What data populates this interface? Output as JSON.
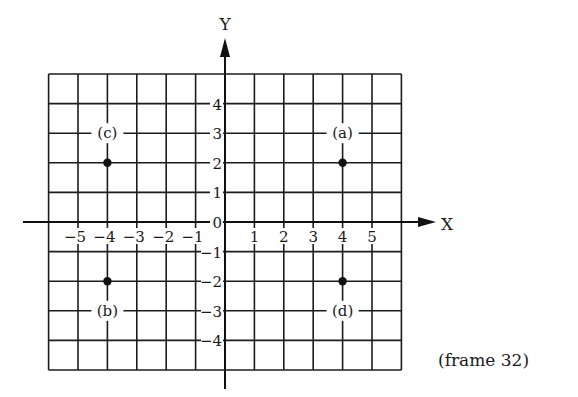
{
  "figure": {
    "caption": "(frame 32)",
    "x_axis_title": "X",
    "y_axis_title": "Y"
  },
  "chart_data": {
    "type": "scatter",
    "title": "",
    "xlabel": "X",
    "ylabel": "Y",
    "xlim": [
      -6,
      6
    ],
    "ylim": [
      -5,
      5
    ],
    "grid": true,
    "x_ticks": [
      -5,
      -4,
      -3,
      -2,
      -1,
      1,
      2,
      3,
      4,
      5
    ],
    "x_tick_labels": [
      "-5",
      "-4",
      "-3",
      "-2",
      "-1",
      "1",
      "2",
      "3",
      "4",
      "5"
    ],
    "y_ticks": [
      4,
      3,
      2,
      1,
      0,
      -1,
      -2,
      -3,
      -4
    ],
    "y_tick_labels": [
      "4",
      "3",
      "2",
      "1",
      "0",
      "-1",
      "-2",
      "-3",
      "-4"
    ],
    "points": [
      {
        "label": "(a)",
        "x": 4,
        "y": 2
      },
      {
        "label": "(b)",
        "x": -4,
        "y": -2
      },
      {
        "label": "(c)",
        "x": -4,
        "y": 2
      },
      {
        "label": "(d)",
        "x": 4,
        "y": -2
      }
    ],
    "annotations": [
      "(frame 32)"
    ],
    "legend": null,
    "point_color": "#111111",
    "line_color": "#1c1c1c"
  }
}
